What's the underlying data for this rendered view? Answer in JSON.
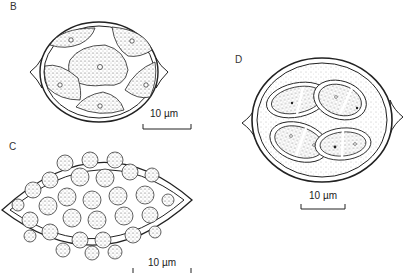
{
  "figure": {
    "panels": [
      {
        "id": "B",
        "label": "B",
        "scale_bar": "10 µm",
        "description": "oval cell with raised polar processes containing five stippled compartments separated by clear bands"
      },
      {
        "id": "C",
        "label": "C",
        "scale_bar": "10 µm",
        "description": "lemon-shaped cell filled with numerous rounded stippled nuclei"
      },
      {
        "id": "D",
        "label": "D",
        "scale_bar": "10 µm",
        "description": "rounded cell with stippled matrix containing four elliptical two-chambered bodies"
      }
    ]
  },
  "colors": {
    "ink": "#222222",
    "stipple": "#bdbdbd",
    "background": "#ffffff"
  }
}
